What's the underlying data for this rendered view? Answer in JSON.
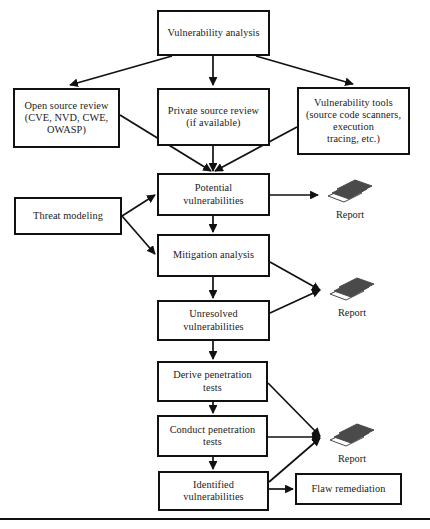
{
  "diagram": {
    "stroke_color": "#111111",
    "fill_color": "#ffffff",
    "report_icon_color": "#4a4a4a",
    "nodes": [
      {
        "id": "vuln-analysis",
        "label": "Vulnerability analysis",
        "x": 157,
        "y": 10,
        "w": 113,
        "h": 46
      },
      {
        "id": "open-source-review",
        "label": "Open source review\n(CVE, NVD, CWE,\nOWASP)",
        "x": 13,
        "y": 88,
        "w": 107,
        "h": 60
      },
      {
        "id": "private-source-review",
        "label": "Private source review\n(if available)",
        "x": 157,
        "y": 88,
        "w": 113,
        "h": 58
      },
      {
        "id": "vulnerability-tools",
        "label": "Vulnerability tools\n(source code scanners,\nexecution\ntracing, etc.)",
        "x": 297,
        "y": 87,
        "w": 113,
        "h": 68
      },
      {
        "id": "potential-vulns",
        "label": "Potential\nvulnerabilities",
        "x": 157,
        "y": 173,
        "w": 113,
        "h": 43
      },
      {
        "id": "threat-modeling",
        "label": "Threat modeling",
        "x": 14,
        "y": 197,
        "w": 108,
        "h": 38
      },
      {
        "id": "mitigation-analysis",
        "label": "Mitigation analysis",
        "x": 157,
        "y": 234,
        "w": 113,
        "h": 43
      },
      {
        "id": "unresolved-vulns",
        "label": "Unresolved\nvulnerabilities",
        "x": 157,
        "y": 300,
        "w": 113,
        "h": 41
      },
      {
        "id": "derive-pen-tests",
        "label": "Derive penetration\ntests",
        "x": 157,
        "y": 361,
        "w": 111,
        "h": 41
      },
      {
        "id": "conduct-pen-tests",
        "label": "Conduct penetration\ntests",
        "x": 157,
        "y": 415,
        "w": 111,
        "h": 42
      },
      {
        "id": "identified-vulns",
        "label": "Identified\nvulnerabilities",
        "x": 158,
        "y": 471,
        "w": 111,
        "h": 40
      },
      {
        "id": "flaw-remediation",
        "label": "Flaw remediation",
        "x": 295,
        "y": 473,
        "w": 107,
        "h": 32
      }
    ],
    "reports": [
      {
        "id": "report-potential",
        "label": "Report",
        "x": 324,
        "y": 178
      },
      {
        "id": "report-unresolved",
        "label": "Report",
        "x": 326,
        "y": 276
      },
      {
        "id": "report-pentest",
        "label": "Report",
        "x": 326,
        "y": 422
      }
    ],
    "edges": [
      {
        "id": "vuln-analysis-to-open-source-review",
        "from": "vuln-analysis",
        "to": "open-source-review",
        "path": "M 172 56 L 70 85",
        "arrow": true
      },
      {
        "id": "vuln-analysis-to-private-source-review",
        "from": "vuln-analysis",
        "to": "private-source-review",
        "path": "M 213 56 L 213 85",
        "arrow": true
      },
      {
        "id": "vuln-analysis-to-vulnerability-tools",
        "from": "vuln-analysis",
        "to": "vulnerability-tools",
        "path": "M 256 56 L 353 84",
        "arrow": true
      },
      {
        "id": "open-source-review-to-potential-vulns",
        "from": "open-source-review",
        "to": "potential-vulns",
        "path": "M 120 115 L 211 171",
        "arrow": true
      },
      {
        "id": "private-source-review-to-potential-vulns",
        "from": "private-source-review",
        "to": "potential-vulns",
        "path": "M 213 146 L 213 171",
        "arrow": true
      },
      {
        "id": "vulnerability-tools-to-potential-vulns",
        "from": "vulnerability-tools",
        "to": "potential-vulns",
        "path": "M 297 127 L 215 171",
        "arrow": true
      },
      {
        "id": "threat-modeling-to-potential-vulns",
        "from": "threat-modeling",
        "to": "potential-vulns",
        "path": "M 122 216 L 155 195",
        "arrow": true
      },
      {
        "id": "threat-modeling-to-mitigation-analysis",
        "from": "threat-modeling",
        "to": "mitigation-analysis",
        "path": "M 122 216 L 155 254",
        "arrow": true
      },
      {
        "id": "potential-vulns-to-report",
        "from": "potential-vulns",
        "to": "report-potential",
        "path": "M 270 195 L 318 195",
        "arrow": true
      },
      {
        "id": "potential-vulns-to-mitigation-analysis",
        "from": "potential-vulns",
        "to": "mitigation-analysis",
        "path": "M 213 216 L 213 232",
        "arrow": true
      },
      {
        "id": "mitigation-analysis-to-report",
        "from": "mitigation-analysis",
        "to": "report-unresolved",
        "path": "M 270 262 L 320 290",
        "arrow": true
      },
      {
        "id": "mitigation-analysis-to-unresolved-vulns",
        "from": "mitigation-analysis",
        "to": "unresolved-vulns",
        "path": "M 213 277 L 213 298",
        "arrow": true
      },
      {
        "id": "unresolved-vulns-to-report",
        "from": "unresolved-vulns",
        "to": "report-unresolved",
        "path": "M 270 313 L 320 290",
        "arrow": true
      },
      {
        "id": "unresolved-vulns-to-derive-pen-tests",
        "from": "unresolved-vulns",
        "to": "derive-pen-tests",
        "path": "M 213 341 L 213 359",
        "arrow": true
      },
      {
        "id": "derive-pen-tests-to-report",
        "from": "derive-pen-tests",
        "to": "report-pentest",
        "path": "M 268 383 L 320 436",
        "arrow": true
      },
      {
        "id": "derive-pen-tests-to-conduct-pen-tests",
        "from": "derive-pen-tests",
        "to": "conduct-pen-tests",
        "path": "M 213 402 L 213 413",
        "arrow": true
      },
      {
        "id": "conduct-pen-tests-to-report",
        "from": "conduct-pen-tests",
        "to": "report-pentest",
        "path": "M 268 437 L 320 437",
        "arrow": true
      },
      {
        "id": "conduct-pen-tests-to-identified-vulns",
        "from": "conduct-pen-tests",
        "to": "identified-vulns",
        "path": "M 213 457 L 213 469",
        "arrow": true
      },
      {
        "id": "identified-vulns-to-report",
        "from": "identified-vulns",
        "to": "report-pentest",
        "path": "M 269 482 L 320 438",
        "arrow": true
      },
      {
        "id": "identified-vulns-to-flaw-remediation",
        "from": "identified-vulns",
        "to": "flaw-remediation",
        "path": "M 269 489 L 293 489",
        "arrow": true
      }
    ],
    "footer_rule": {
      "id": "footer-rule",
      "y": 518
    }
  }
}
